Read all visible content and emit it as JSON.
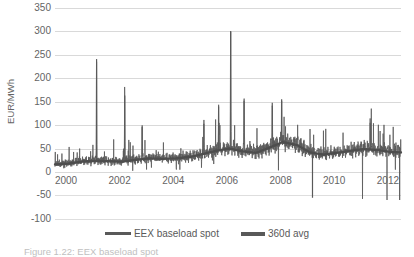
{
  "chart_data": {
    "type": "line",
    "title": "",
    "xlabel": "",
    "ylabel": "EUR/MWh",
    "ylim": [
      -100,
      350
    ],
    "xlim": [
      2000,
      2012.9
    ],
    "grid": true,
    "legend_position": "bottom",
    "y_ticks": [
      350,
      300,
      250,
      200,
      150,
      100,
      50,
      0
    ],
    "y_ticks_below": [
      -50,
      -100
    ],
    "x_ticks": [
      2000,
      2002,
      2004,
      2006,
      2008,
      2010,
      2012
    ],
    "series": [
      {
        "name": "EEX baseload spot",
        "color": "#595959",
        "description": "Daily German EEX baseload electricity spot price, noisy series with large upward price spikes and occasional negative prices",
        "notable_points": [
          {
            "x": 2001.55,
            "y": 241,
            "label": "spike 2001"
          },
          {
            "x": 2002.6,
            "y": 163,
            "label": "spike 2002"
          },
          {
            "x": 2003.25,
            "y": 100,
            "label": "spike 2003"
          },
          {
            "x": 2005.55,
            "y": 103,
            "label": "spike 2005"
          },
          {
            "x": 2006.1,
            "y": 140,
            "label": "spike early 2006"
          },
          {
            "x": 2006.55,
            "y": 301,
            "label": "maximum spike 2006"
          },
          {
            "x": 2007.05,
            "y": 152,
            "label": "spike 2007"
          },
          {
            "x": 2008.1,
            "y": 148,
            "label": "spike 2008"
          },
          {
            "x": 2008.45,
            "y": 155,
            "label": "spike mid 2008"
          },
          {
            "x": 2009.6,
            "y": -55,
            "label": "negative price 2009"
          },
          {
            "x": 2011.75,
            "y": 105,
            "label": "spike 2011"
          },
          {
            "x": 2012.85,
            "y": -60,
            "label": "negative price 2012"
          }
        ],
        "baseline_range": [
          10,
          60
        ]
      },
      {
        "name": "360d avg",
        "color": "#595959",
        "description": "360-day rolling average of the spot price",
        "points": [
          {
            "x": 2000.0,
            "y": 16
          },
          {
            "x": 2000.5,
            "y": 18
          },
          {
            "x": 2001.0,
            "y": 22
          },
          {
            "x": 2001.5,
            "y": 24
          },
          {
            "x": 2002.0,
            "y": 23
          },
          {
            "x": 2002.5,
            "y": 22
          },
          {
            "x": 2003.0,
            "y": 26
          },
          {
            "x": 2003.5,
            "y": 29
          },
          {
            "x": 2004.0,
            "y": 28
          },
          {
            "x": 2004.5,
            "y": 29
          },
          {
            "x": 2005.0,
            "y": 32
          },
          {
            "x": 2005.5,
            "y": 38
          },
          {
            "x": 2006.0,
            "y": 45
          },
          {
            "x": 2006.5,
            "y": 50
          },
          {
            "x": 2007.0,
            "y": 44
          },
          {
            "x": 2007.5,
            "y": 41
          },
          {
            "x": 2008.0,
            "y": 52
          },
          {
            "x": 2008.5,
            "y": 64
          },
          {
            "x": 2009.0,
            "y": 58
          },
          {
            "x": 2009.5,
            "y": 42
          },
          {
            "x": 2010.0,
            "y": 37
          },
          {
            "x": 2010.5,
            "y": 41
          },
          {
            "x": 2011.0,
            "y": 45
          },
          {
            "x": 2011.5,
            "y": 49
          },
          {
            "x": 2012.0,
            "y": 47
          },
          {
            "x": 2012.5,
            "y": 43
          },
          {
            "x": 2012.9,
            "y": 42
          }
        ]
      }
    ]
  },
  "axis": {
    "y_title": "EUR/MWh",
    "y_labels": [
      "350",
      "300",
      "250",
      "200",
      "150",
      "100",
      "50",
      "0"
    ],
    "y_labels_below": [
      "-50",
      "-100"
    ],
    "x_labels": [
      "2000",
      "2002",
      "2004",
      "2006",
      "2008",
      "2010",
      "2012"
    ]
  },
  "legend": {
    "entries": [
      {
        "label": "EEX baseload spot",
        "color": "#595959"
      },
      {
        "label": "360d avg",
        "color": "#595959"
      }
    ]
  },
  "caption": {
    "text": "Figure 1.22:  EEX baseload spot"
  }
}
